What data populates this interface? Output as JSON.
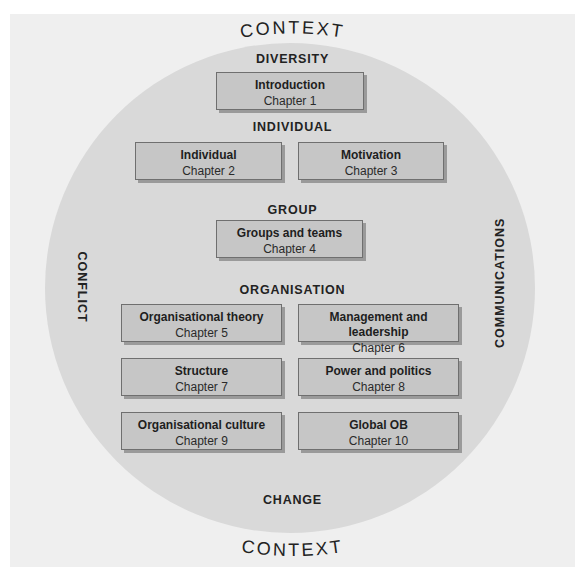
{
  "outer_label": "CONTEXT",
  "headings": {
    "top": "DIVERSITY",
    "individual": "INDIVIDUAL",
    "group": "GROUP",
    "organisation": "ORGANISATION",
    "bottom": "CHANGE",
    "left": "CONFLICT",
    "right": "COMMUNICATIONS"
  },
  "boxes": [
    {
      "title": "Introduction",
      "chapter": "Chapter 1"
    },
    {
      "title": "Individual",
      "chapter": "Chapter 2"
    },
    {
      "title": "Motivation",
      "chapter": "Chapter 3"
    },
    {
      "title": "Groups and teams",
      "chapter": "Chapter 4"
    },
    {
      "title": "Organisational theory",
      "chapter": "Chapter 5"
    },
    {
      "title": "Management and leadership",
      "chapter": "Chapter 6"
    },
    {
      "title": "Structure",
      "chapter": "Chapter 7"
    },
    {
      "title": "Power and politics",
      "chapter": "Chapter 8"
    },
    {
      "title": "Organisational culture",
      "chapter": "Chapter 9"
    },
    {
      "title": "Global OB",
      "chapter": "Chapter 10"
    }
  ],
  "colors": {
    "frame": "#efefef",
    "circle": "#d9d9d9",
    "box_fill": "#c6c6c6",
    "box_border": "#6f6f6f",
    "box_shadow": "#9a9a9a",
    "text": "#222222"
  }
}
